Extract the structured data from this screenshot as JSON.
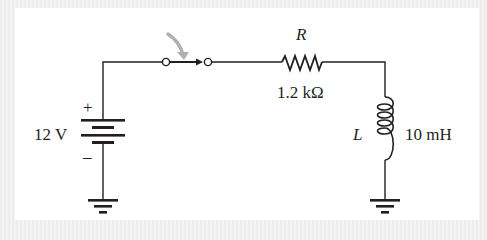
{
  "diagram": {
    "type": "circuit-schematic",
    "components": {
      "source": {
        "label": "12 V",
        "plus": "+",
        "minus": "–"
      },
      "switch": {
        "state": "closing",
        "arrow_color": "#b0b0b0"
      },
      "resistor": {
        "symbol": "R",
        "value": "1.2 kΩ"
      },
      "inductor": {
        "symbol": "L",
        "value": "10 mH"
      },
      "grounds": 2
    },
    "colors": {
      "wire": "#231f20",
      "background": "#ffffff",
      "border": "#eeeeee",
      "arrow": "#b0b0b0"
    }
  }
}
